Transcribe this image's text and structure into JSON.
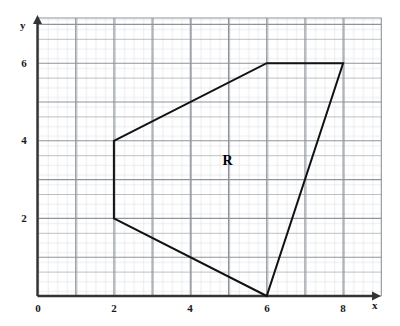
{
  "chart_data": {
    "type": "scatter",
    "title": "",
    "xlabel": "x",
    "ylabel": "y",
    "xlim": [
      0,
      9
    ],
    "ylim": [
      0,
      7.2
    ],
    "grid": true,
    "grid_major_step": 1,
    "grid_minor_step": 0.25,
    "legend": "none",
    "x_ticks": [
      {
        "value": 0,
        "label": "0"
      },
      {
        "value": 2,
        "label": "2"
      },
      {
        "value": 4,
        "label": "4"
      },
      {
        "value": 6,
        "label": "6"
      },
      {
        "value": 8,
        "label": "8"
      }
    ],
    "y_ticks": [
      {
        "value": 0,
        "label": "0"
      },
      {
        "value": 2,
        "label": "2"
      },
      {
        "value": 4,
        "label": "4"
      },
      {
        "value": 6,
        "label": "6"
      }
    ],
    "shapes": [
      {
        "name": "region-R",
        "type": "polygon",
        "label": "R",
        "label_position": {
          "x": 5.0,
          "y": 3.45
        },
        "closed": true,
        "fill": "none",
        "stroke": "#111111",
        "stroke_width": 2,
        "vertices": [
          {
            "x": 2,
            "y": 4
          },
          {
            "x": 6,
            "y": 6
          },
          {
            "x": 8,
            "y": 6
          },
          {
            "x": 6,
            "y": 0
          },
          {
            "x": 2,
            "y": 2
          }
        ]
      }
    ],
    "axis_arrows": {
      "x": true,
      "y": true
    },
    "colors": {
      "axis": "#333333",
      "grid_major": "#9aa0a6",
      "grid_minor": "#c9ccd1",
      "polygon_stroke": "#111111",
      "text": "#1a1a1a",
      "background": "#ffffff"
    }
  },
  "labels": {
    "x_axis_name": "x",
    "y_axis_name": "y",
    "region": "R",
    "x_tick_0": "0",
    "x_tick_2": "2",
    "x_tick_4": "4",
    "x_tick_6": "6",
    "x_tick_8": "8",
    "y_tick_0": "0",
    "y_tick_2": "2",
    "y_tick_4": "4",
    "y_tick_6": "6"
  }
}
